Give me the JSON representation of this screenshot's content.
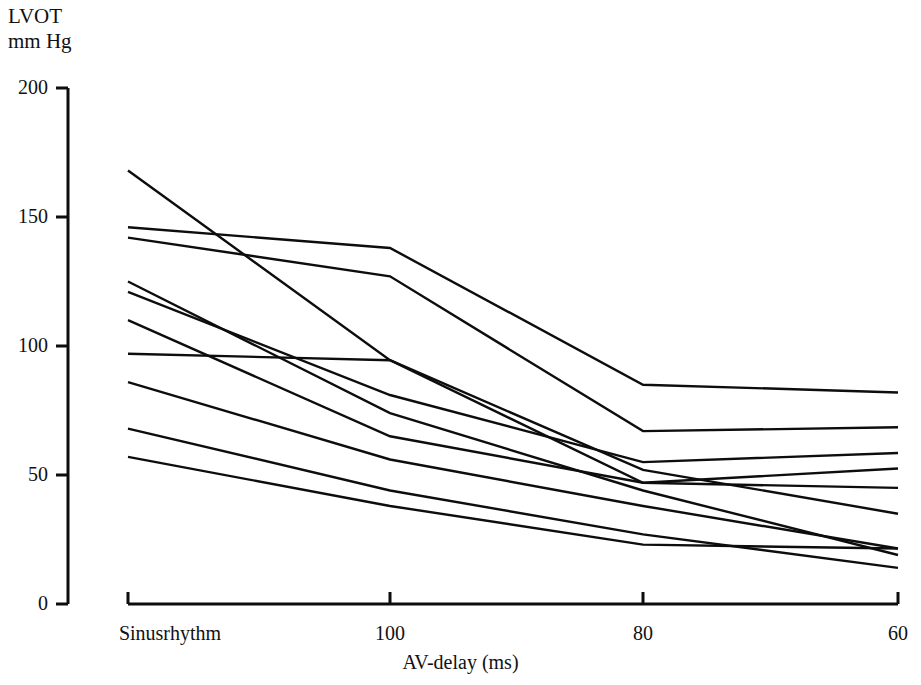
{
  "chart_data": {
    "type": "line",
    "title": "",
    "ylabel": "LVOT\nmm Hg",
    "ylabel_line1": "LVOT",
    "ylabel_line2": "mm Hg",
    "xlabel": "AV-delay (ms)",
    "categories": [
      "Sinusrhythm",
      "100",
      "80",
      "60"
    ],
    "xtick_labels": [
      "Sinusrhythm",
      "100",
      "80",
      "60"
    ],
    "ytick_labels": [
      "0",
      "50",
      "100",
      "150",
      "200"
    ],
    "ytick_values": [
      0,
      50,
      100,
      150,
      200
    ],
    "ylim": [
      0,
      200
    ],
    "grid": false,
    "legend": false,
    "legend_position": "none",
    "line_color": "#0d0d0d",
    "series": [
      {
        "name": "patient-1",
        "values": [
          168,
          94.5,
          52,
          35
        ]
      },
      {
        "name": "patient-2",
        "values": [
          146,
          138,
          85,
          82
        ]
      },
      {
        "name": "patient-3",
        "values": [
          142,
          127,
          67,
          68.5
        ]
      },
      {
        "name": "patient-4",
        "values": [
          125,
          74,
          44,
          19
        ]
      },
      {
        "name": "patient-5",
        "values": [
          121,
          81,
          55,
          58.5
        ]
      },
      {
        "name": "patient-6",
        "values": [
          110,
          65,
          47,
          45
        ]
      },
      {
        "name": "patient-7",
        "values": [
          97,
          94.5,
          47,
          52.5
        ]
      },
      {
        "name": "patient-8",
        "values": [
          86,
          56,
          38,
          21.5
        ]
      },
      {
        "name": "patient-9",
        "values": [
          68,
          44,
          27,
          14
        ]
      },
      {
        "name": "patient-10",
        "values": [
          57,
          38,
          23,
          21.5
        ]
      }
    ]
  },
  "figure": {
    "axis_name": "lvot-gradient-chart"
  }
}
